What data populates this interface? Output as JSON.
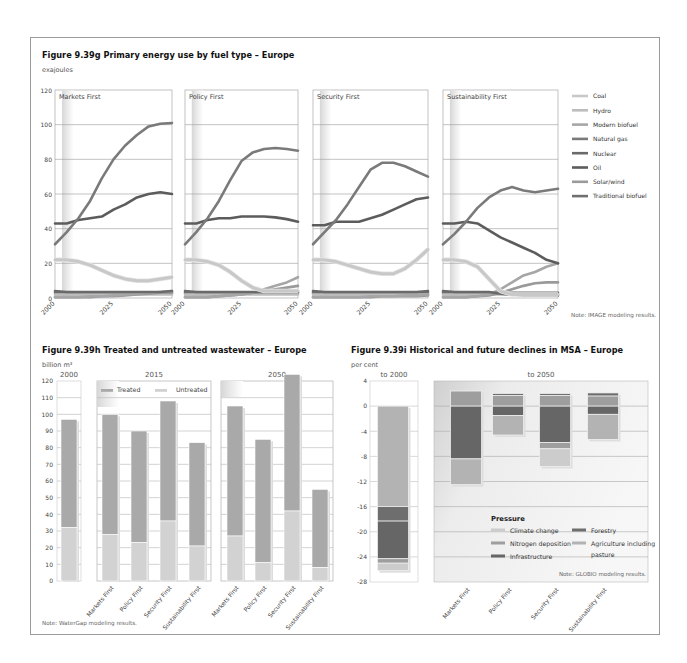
{
  "figure_g": {
    "title": "Figure 9.39g  Primary energy use by fuel type – Europe",
    "unit": "exajoules",
    "note": "Note: IMAGE modeling results."
  },
  "figure_h": {
    "title": "Figure 9.39h Treated and untreated wastewater – Europe",
    "unit": "billion m³",
    "note": "Note: WaterGap modeling results."
  },
  "figure_i": {
    "title": "Figure 9.39i Historical and future declines in MSA – Europe",
    "unit": "per cent",
    "note": "Note: GLOBIO modeling results."
  },
  "colors": {
    "coal": "#c8c8c8",
    "hydro": "#bdbdbd",
    "modern_biofuel": "#a6a6a6",
    "natural_gas": "#7a7a7a",
    "nuclear": "#6a6a6a",
    "oil": "#5c5c5c",
    "solar_wind": "#9a9a9a",
    "traditional_biofuel": "#707070",
    "treated": "#a9a9a9",
    "untreated": "#d2d2d2",
    "climate_change": "#cccccc",
    "nitrogen": "#9e9e9e",
    "infrastructure": "#666666",
    "forestry": "#6e6e6e",
    "agriculture": "#b3b3b3"
  },
  "chart_data": [
    {
      "type": "line",
      "title": "Figure 9.39g Primary energy use by fuel type – Europe",
      "ylabel": "exajoules",
      "ylim": [
        0,
        120
      ],
      "yticks": [
        0,
        20,
        40,
        60,
        80,
        100,
        120
      ],
      "x": [
        2000,
        2005,
        2010,
        2015,
        2020,
        2025,
        2030,
        2035,
        2040,
        2045,
        2050
      ],
      "xticks": [
        "2000",
        "2025",
        "2050"
      ],
      "legend": [
        "Coal",
        "Hydro",
        "Modern biofuel",
        "Natural gas",
        "Nuclear",
        "Oil",
        "Solar/wind",
        "Traditional biofuel"
      ],
      "panels": [
        {
          "name": "Markets First",
          "series": [
            {
              "name": "Natural gas",
              "values": [
                31,
                38,
                46,
                56,
                69,
                80,
                88,
                94,
                99,
                100.5,
                101
              ]
            },
            {
              "name": "Oil",
              "values": [
                43,
                43,
                45,
                46,
                47,
                51,
                54,
                58,
                60,
                61,
                60
              ]
            },
            {
              "name": "Coal",
              "values": [
                22,
                22,
                21,
                19,
                16,
                13,
                11,
                10,
                10,
                11,
                12
              ]
            },
            {
              "name": "Nuclear",
              "values": [
                4,
                3.5,
                3.5,
                3.5,
                3.5,
                3.5,
                3.5,
                3.5,
                3.5,
                3.5,
                4
              ]
            },
            {
              "name": "Hydro",
              "values": [
                2,
                2,
                2,
                2,
                2,
                2,
                2,
                2,
                2,
                2,
                2
              ]
            },
            {
              "name": "Modern biofuel",
              "values": [
                0.5,
                0.5,
                0.5,
                1,
                1,
                1.5,
                2,
                2.5,
                3,
                3.5,
                4
              ]
            },
            {
              "name": "Solar/wind",
              "values": [
                0.5,
                0.5,
                0.5,
                0.5,
                1,
                1,
                1.5,
                2,
                2.5,
                3,
                3
              ]
            },
            {
              "name": "Traditional biofuel",
              "values": [
                3,
                3,
                3,
                3,
                3,
                3,
                3,
                3,
                3,
                3,
                3
              ]
            }
          ]
        },
        {
          "name": "Policy First",
          "series": [
            {
              "name": "Natural gas",
              "values": [
                31,
                38,
                46,
                56,
                68,
                79,
                84,
                86,
                86.5,
                86,
                85
              ]
            },
            {
              "name": "Oil",
              "values": [
                43,
                43,
                45,
                46,
                46,
                47,
                47,
                47,
                46.5,
                45.5,
                44
              ]
            },
            {
              "name": "Coal",
              "values": [
                22,
                22,
                21,
                19,
                15,
                10,
                6,
                4,
                4,
                4,
                4
              ]
            },
            {
              "name": "Nuclear",
              "values": [
                4,
                3.5,
                3.5,
                3.5,
                3.5,
                3.5,
                3.5,
                3.5,
                3.5,
                3.5,
                3.5
              ]
            },
            {
              "name": "Hydro",
              "values": [
                2,
                2,
                2,
                2,
                2,
                2,
                2,
                2,
                2,
                2,
                2
              ]
            },
            {
              "name": "Modern biofuel",
              "values": [
                0.5,
                0.5,
                0.5,
                1,
                1.5,
                2,
                3,
                5,
                7,
                9,
                12
              ]
            },
            {
              "name": "Solar/wind",
              "values": [
                0.5,
                0.5,
                0.5,
                1,
                1.5,
                2,
                3,
                4,
                5,
                6,
                7
              ]
            },
            {
              "name": "Traditional biofuel",
              "values": [
                3,
                3,
                3,
                3,
                3,
                3,
                3,
                3,
                3,
                3,
                3
              ]
            }
          ]
        },
        {
          "name": "Security First",
          "series": [
            {
              "name": "Natural gas",
              "values": [
                31,
                38,
                45,
                54,
                64,
                74,
                78,
                78,
                76,
                73,
                70
              ]
            },
            {
              "name": "Oil",
              "values": [
                42,
                42,
                44,
                44,
                44,
                46,
                48,
                51,
                54,
                57,
                58
              ]
            },
            {
              "name": "Coal",
              "values": [
                22,
                22,
                21,
                19,
                17,
                15,
                14,
                14,
                17,
                22,
                28
              ]
            },
            {
              "name": "Nuclear",
              "values": [
                4,
                3.5,
                3.5,
                3.5,
                3.5,
                3.5,
                3.5,
                3.5,
                3.5,
                3.5,
                4
              ]
            },
            {
              "name": "Hydro",
              "values": [
                2,
                2,
                2,
                2,
                2,
                2,
                2,
                2,
                2,
                2,
                2
              ]
            },
            {
              "name": "Modern biofuel",
              "values": [
                0.5,
                0.5,
                0.5,
                0.5,
                0.5,
                1,
                1,
                1,
                1.5,
                1.5,
                2
              ]
            },
            {
              "name": "Solar/wind",
              "values": [
                0.5,
                0.5,
                0.5,
                0.5,
                0.5,
                0.5,
                1,
                1,
                1,
                1,
                1.5
              ]
            },
            {
              "name": "Traditional biofuel",
              "values": [
                3,
                3,
                3,
                3,
                3,
                3,
                3,
                3,
                3,
                3,
                3
              ]
            }
          ]
        },
        {
          "name": "Sustainability First",
          "series": [
            {
              "name": "Natural gas",
              "values": [
                31,
                37,
                44,
                52,
                58,
                62,
                64,
                62,
                61,
                62,
                63
              ]
            },
            {
              "name": "Oil",
              "values": [
                43,
                43,
                44,
                43,
                39,
                35,
                32,
                29,
                26,
                22,
                20
              ]
            },
            {
              "name": "Coal",
              "values": [
                22,
                22,
                21,
                18,
                11,
                4,
                2,
                2,
                2,
                2,
                2
              ]
            },
            {
              "name": "Nuclear",
              "values": [
                4,
                3.5,
                3.5,
                3.5,
                3.5,
                2.5,
                2,
                1.5,
                1.5,
                1.5,
                1.5
              ]
            },
            {
              "name": "Hydro",
              "values": [
                2,
                2,
                2,
                2,
                2,
                2,
                2,
                2,
                2,
                2,
                2
              ]
            },
            {
              "name": "Modern biofuel",
              "values": [
                0.5,
                0.5,
                0.5,
                1,
                2,
                5,
                9,
                13,
                15,
                18,
                20
              ]
            },
            {
              "name": "Solar/wind",
              "values": [
                0.5,
                0.5,
                0.5,
                1,
                1.5,
                3,
                5,
                7,
                8.5,
                9,
                9
              ]
            },
            {
              "name": "Traditional biofuel",
              "values": [
                3,
                3,
                3,
                3,
                3,
                3,
                3,
                3,
                3,
                3,
                3
              ]
            }
          ]
        }
      ]
    },
    {
      "type": "bar",
      "stacked": true,
      "title": "Figure 9.39h Treated and untreated wastewater – Europe",
      "ylabel": "billion m³",
      "ylim": [
        0,
        120
      ],
      "yticks": [
        0,
        10,
        20,
        30,
        40,
        50,
        60,
        70,
        80,
        90,
        100,
        110,
        120
      ],
      "groups": [
        "2000",
        "2015",
        "2050"
      ],
      "legend": [
        "Treated",
        "Untreated"
      ],
      "bars": [
        {
          "group": "2000",
          "category": "",
          "untreated": 32,
          "treated": 65,
          "total": 97
        },
        {
          "group": "2015",
          "category": "Markets First",
          "untreated": 28,
          "treated": 72,
          "total": 100
        },
        {
          "group": "2015",
          "category": "Policy First",
          "untreated": 23,
          "treated": 67,
          "total": 90
        },
        {
          "group": "2015",
          "category": "Security First",
          "untreated": 36,
          "treated": 72,
          "total": 108
        },
        {
          "group": "2015",
          "category": "Sustainability First",
          "untreated": 21,
          "treated": 62,
          "total": 83
        },
        {
          "group": "2050",
          "category": "Markets First",
          "untreated": 27,
          "treated": 78,
          "total": 105
        },
        {
          "group": "2050",
          "category": "Policy First",
          "untreated": 11,
          "treated": 74,
          "total": 85
        },
        {
          "group": "2050",
          "category": "Security First",
          "untreated": 42,
          "treated": 82,
          "total": 124
        },
        {
          "group": "2050",
          "category": "Sustainability First",
          "untreated": 8,
          "treated": 47,
          "total": 55
        }
      ]
    },
    {
      "type": "bar",
      "stacked": true,
      "title": "Figure 9.39i Historical and future declines in MSA – Europe",
      "ylabel": "per cent",
      "ylim": [
        -28,
        4
      ],
      "yticks": [
        4,
        0,
        -4,
        -8,
        -12,
        -16,
        -20,
        -24,
        -28
      ],
      "groups": [
        "to 2000",
        "to 2050"
      ],
      "legend_title": "Pressure",
      "legend": [
        "Climate change",
        "Nitrogen deposition",
        "Infrastructure",
        "Forestry",
        "Agriculture including pasture"
      ],
      "bars": [
        {
          "group": "to 2000",
          "category": "",
          "segments": [
            {
              "name": "Agriculture including pasture",
              "from": 0,
              "to": -16
            },
            {
              "name": "Forestry",
              "from": -16,
              "to": -18.3
            },
            {
              "name": "Infrastructure",
              "from": -18.3,
              "to": -24.3
            },
            {
              "name": "Nitrogen deposition",
              "from": -24.3,
              "to": -25
            },
            {
              "name": "Climate change",
              "from": -25,
              "to": -26.2
            }
          ]
        },
        {
          "group": "to 2050",
          "category": "Markets First",
          "segments": [
            {
              "name": "Nitrogen deposition",
              "from": 2.4,
              "to": 0
            },
            {
              "name": "Infrastructure",
              "from": 0,
              "to": -8.4
            },
            {
              "name": "Agriculture including pasture",
              "from": -8.4,
              "to": -12.5
            }
          ]
        },
        {
          "group": "to 2050",
          "category": "Policy First",
          "segments": [
            {
              "name": "Forestry",
              "from": 2,
              "to": 1.7
            },
            {
              "name": "Nitrogen deposition",
              "from": 1.7,
              "to": 0
            },
            {
              "name": "Infrastructure",
              "from": 0,
              "to": -1.5
            },
            {
              "name": "Agriculture including pasture",
              "from": -1.5,
              "to": -4.6
            }
          ]
        },
        {
          "group": "to 2050",
          "category": "Security First",
          "segments": [
            {
              "name": "Forestry",
              "from": 2,
              "to": 1.7
            },
            {
              "name": "Nitrogen deposition",
              "from": 1.7,
              "to": 0
            },
            {
              "name": "Infrastructure",
              "from": 0,
              "to": -5.8
            },
            {
              "name": "Nitrogen deposition",
              "from": -5.8,
              "to": -6.8
            },
            {
              "name": "Climate change",
              "from": -6.8,
              "to": -9.6
            }
          ]
        },
        {
          "group": "to 2050",
          "category": "Sustainability First",
          "segments": [
            {
              "name": "Forestry",
              "from": 2.1,
              "to": 1.6
            },
            {
              "name": "Nitrogen deposition",
              "from": 1.6,
              "to": 0
            },
            {
              "name": "Infrastructure",
              "from": 0,
              "to": -1.3
            },
            {
              "name": "Agriculture including pasture",
              "from": -1.3,
              "to": -5.3
            }
          ]
        }
      ]
    }
  ]
}
